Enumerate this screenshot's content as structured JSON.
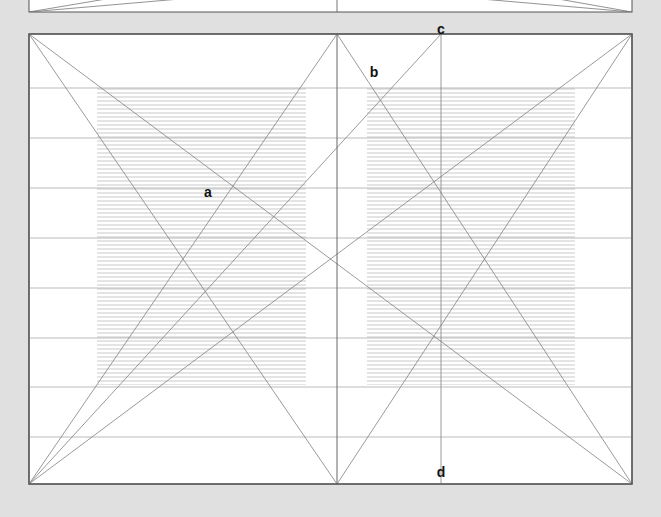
{
  "page": {
    "background_color": "#e0e0e0",
    "width": 661,
    "height": 517
  },
  "panels": {
    "top_partial": {
      "name": "upper-chart-partial",
      "x": 29,
      "y": -40,
      "width": 603,
      "height": 52,
      "border_color": "#555555",
      "fill_color": "#ffffff",
      "note": "bottom sliver of a preceding chart panel"
    },
    "main": {
      "name": "main-chart-panel",
      "x": 29,
      "y": 34,
      "width": 603,
      "height": 450,
      "border_color": "#555555",
      "fill_color": "#ffffff"
    }
  },
  "chart_data": {
    "type": "bar",
    "title": "",
    "subtitle": "",
    "xlabel": "",
    "ylabel": "",
    "grid": true,
    "legend_position": "none",
    "xlim": [
      0,
      603
    ],
    "ylim": [
      0,
      450
    ],
    "gridlines_y": [
      88,
      138,
      188,
      238,
      288,
      338,
      387,
      437
    ],
    "gridline_color": "#aaaaaa",
    "vertical_divider_x": 337,
    "vertical_divider_color": "#666666",
    "bar_fill": "#e9e9e9",
    "bar_hatch": "horizontal-lines",
    "categories": [
      "bar-1",
      "bar-2",
      "bar-3"
    ],
    "bars": [
      {
        "label": "bar-1",
        "x": 97,
        "width": 209,
        "top": 88,
        "bottom": 385,
        "value": 297
      },
      {
        "label": "bar-2",
        "x": 367,
        "width": 143,
        "top": 88,
        "bottom": 385,
        "value": 297
      },
      {
        "label": "bar-3",
        "x": 510,
        "width": 65,
        "top": 88,
        "bottom": 385,
        "value": 297
      }
    ],
    "guide_lines": [
      {
        "name": "diag-tl-to-br",
        "x1": 29,
        "y1": 34,
        "x2": 632,
        "y2": 484
      },
      {
        "name": "diag-bl-to-tr",
        "x1": 29,
        "y1": 484,
        "x2": 632,
        "y2": 34
      },
      {
        "name": "diag-tl-mid-bottom",
        "x1": 29,
        "y1": 34,
        "x2": 337,
        "y2": 484
      },
      {
        "name": "diag-bl-to-mid-top",
        "x1": 29,
        "y1": 484,
        "x2": 337,
        "y2": 34
      },
      {
        "name": "diag-mid-top-to-br",
        "x1": 337,
        "y1": 34,
        "x2": 632,
        "y2": 484
      },
      {
        "name": "diag-bl-to-c",
        "x1": 29,
        "y1": 484,
        "x2": 441,
        "y2": 34
      },
      {
        "name": "diag-mid-bottom-to-tr",
        "x1": 337,
        "y1": 484,
        "x2": 632,
        "y2": 34
      },
      {
        "name": "vertical-c-line",
        "x1": 441,
        "y1": 34,
        "x2": 441,
        "y2": 484
      }
    ],
    "annotations": [
      {
        "id": "a",
        "label": "a",
        "x": 208,
        "y": 192
      },
      {
        "id": "b",
        "label": "b",
        "x": 374,
        "y": 72
      },
      {
        "id": "c",
        "label": "c",
        "x": 441,
        "y": 29
      },
      {
        "id": "d",
        "label": "d",
        "x": 441,
        "y": 472
      }
    ]
  }
}
